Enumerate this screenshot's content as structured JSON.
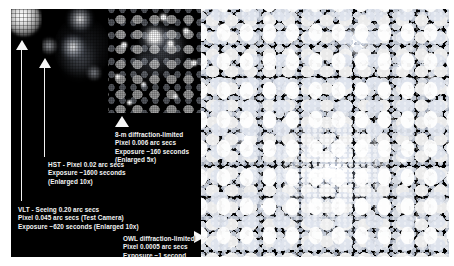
{
  "figure": {
    "background_color": "#ffffff",
    "sky_color": "#000000",
    "annotation_color": "#f4f4f4"
  },
  "panels": [
    {
      "id": "hst",
      "name": "hst-panel",
      "instrument": "HST",
      "description": "Small heavily-pixelated blurred star blob, enlarged 10x"
    },
    {
      "id": "vlt",
      "name": "vlt-panel",
      "instrument": "VLT",
      "description": "Seeing-limited field with a few soft stars and faint nebulosity, enlarged 10x"
    },
    {
      "id": "8m",
      "name": "eight-metre-panel",
      "instrument": "8-m diffraction-limited",
      "description": "Sharper field resolving more stars and nebular structure, enlarged 5x"
    },
    {
      "id": "owl",
      "name": "owl-panel",
      "instrument": "OWL diffraction-limited",
      "description": "Large dense star cluster with thousands of sharp point sources and filamentary nebulosity"
    }
  ],
  "captions": {
    "eight_metre": {
      "lines": [
        "8-m diffraction-limited",
        "Pixel 0.006 arc secs",
        "Exposure ~160 seconds",
        "(Enlarged 5x)"
      ]
    },
    "hst": {
      "lines": [
        "HST - Pixel 0.02 arc secs",
        "Exposure ~1600 seconds",
        "(Enlarged 10x)"
      ]
    },
    "vlt": {
      "lines": [
        "VLT - Seeing 0.20 arc secs",
        "Pixel 0.045 arc secs (Test Camera)",
        "Exposure ~620 seconds (Enlarged 10x)"
      ]
    },
    "owl": {
      "lines": [
        "OWL diffraction-limited",
        "Pixel 0.0005 arc secs",
        "Exposure ~1 second"
      ]
    }
  },
  "pointers": [
    {
      "name": "arrow-to-vlt-panel",
      "kind": "arrow-up"
    },
    {
      "name": "arrow-to-hst-panel",
      "kind": "arrow-up"
    },
    {
      "name": "triangle-to-eight-metre-panel",
      "kind": "triangle-up"
    },
    {
      "name": "triangle-to-owl-panel",
      "kind": "triangle-right"
    }
  ]
}
